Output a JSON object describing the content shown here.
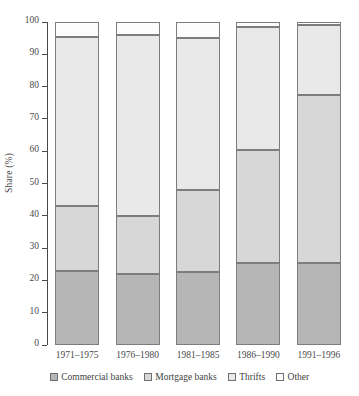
{
  "chart_data": {
    "type": "bar",
    "subtype": "stacked-100-percent-column",
    "title": "",
    "xlabel": "",
    "ylabel": "Share (%)",
    "ylim": [
      0,
      100
    ],
    "ytick_labels": [
      "0",
      "10",
      "20",
      "30",
      "40",
      "50",
      "60",
      "70",
      "80",
      "90",
      "100"
    ],
    "ytick_values": [
      0,
      10,
      20,
      30,
      40,
      50,
      60,
      70,
      80,
      90,
      100
    ],
    "grid": false,
    "legend_position": "bottom",
    "categories": [
      "1971–1975",
      "1976–1980",
      "1981–1985",
      "1986–1990",
      "1991–1996"
    ],
    "series": [
      {
        "name": "Commercial banks",
        "color": "#b6b6b6",
        "values": [
          23.0,
          22.0,
          22.5,
          25.5,
          25.5
        ]
      },
      {
        "name": "Mortgage banks",
        "color": "#d7d7d7",
        "values": [
          20.0,
          18.0,
          25.5,
          35.0,
          52.0
        ]
      },
      {
        "name": "Thrifts",
        "color": "#e9e9e9",
        "values": [
          52.5,
          56.0,
          47.0,
          38.0,
          21.5
        ]
      },
      {
        "name": "Other",
        "color": "#fcfcfc",
        "values": [
          4.5,
          4.0,
          5.0,
          1.5,
          1.0
        ]
      }
    ],
    "cumulative_tops": [
      [
        23.0,
        43.0,
        95.5,
        100.0
      ],
      [
        22.0,
        40.0,
        96.0,
        100.0
      ],
      [
        22.5,
        48.0,
        95.0,
        100.0
      ],
      [
        25.5,
        60.5,
        98.5,
        100.0
      ],
      [
        25.5,
        77.5,
        99.0,
        100.0
      ]
    ]
  },
  "legend": {
    "items": [
      {
        "label": "Commercial banks"
      },
      {
        "label": "Mortgage banks"
      },
      {
        "label": "Thrifts"
      },
      {
        "label": "Other"
      }
    ]
  }
}
